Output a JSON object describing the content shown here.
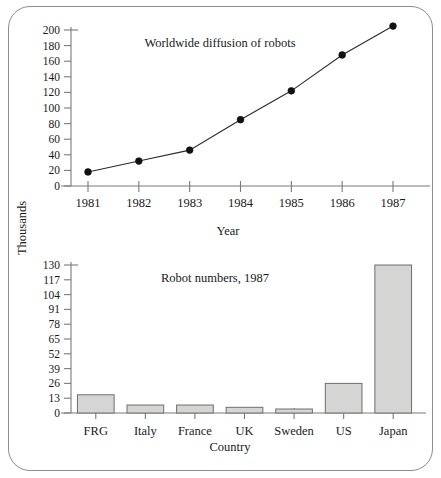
{
  "figure": {
    "border_color": "#8d8d8d",
    "background": "#ffffff"
  },
  "chart_data": [
    {
      "type": "line",
      "title": "Worldwide diffusion of robots",
      "xlabel": "Year",
      "ylabel": "Thousands",
      "categories": [
        "1981",
        "1982",
        "1983",
        "1984",
        "1985",
        "1986",
        "1987"
      ],
      "x": [
        1981,
        1982,
        1983,
        1984,
        1985,
        1986,
        1987
      ],
      "values": [
        18,
        32,
        46,
        85,
        122,
        168,
        205
      ],
      "ytick_labels": [
        "0",
        "20",
        "40",
        "60",
        "80",
        "100",
        "120",
        "140",
        "160",
        "180",
        "200"
      ],
      "yticks": [
        0,
        20,
        40,
        60,
        80,
        100,
        120,
        140,
        160,
        180,
        200
      ],
      "ylim": [
        0,
        205
      ],
      "grid": false,
      "legend": "none",
      "marker": "filled-circle",
      "line_color": "#2b2b2b",
      "marker_color": "#111111"
    },
    {
      "type": "bar",
      "title": "Robot numbers, 1987",
      "xlabel": "Country",
      "ylabel": "Thousands",
      "categories": [
        "FRG",
        "Italy",
        "France",
        "UK",
        "Sweden",
        "US",
        "Japan"
      ],
      "values": [
        16,
        7,
        7,
        5,
        3.5,
        26,
        130
      ],
      "ytick_labels": [
        "0",
        "13",
        "26",
        "39",
        "52",
        "65",
        "78",
        "91",
        "104",
        "117",
        "130"
      ],
      "yticks": [
        0,
        13,
        26,
        39,
        52,
        65,
        78,
        91,
        104,
        117,
        130
      ],
      "ylim": [
        0,
        130
      ],
      "grid": false,
      "legend": "none",
      "bar_fill": "#d5d5d3",
      "bar_stroke": "#6f6f6f"
    }
  ]
}
